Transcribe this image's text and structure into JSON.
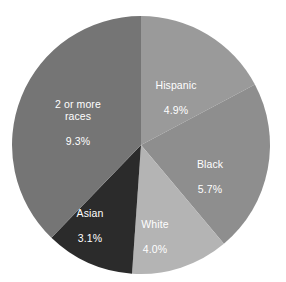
{
  "chart_data": {
    "type": "pie",
    "title": "",
    "subtitle": "",
    "xlabel": "",
    "ylabel": "",
    "legend": "none",
    "grid": false,
    "start_angle_deg": 0,
    "direction": "clockwise",
    "center": {
      "x": 141,
      "y": 145
    },
    "radius": 129,
    "categories": [
      "Hispanic",
      "Black",
      "White",
      "Asian",
      "2 or more races"
    ],
    "values": [
      4.9,
      5.7,
      4.0,
      3.1,
      9.3
    ],
    "value_suffix": "%",
    "slice_angles_deg": [
      62,
      78,
      44,
      40,
      136
    ],
    "colors": [
      "#9a9a9a",
      "#8e8e8e",
      "#b4b4b4",
      "#2b2b2b",
      "#757575"
    ],
    "slices": [
      {
        "label": "Hispanic",
        "value": 4.9,
        "value_text": "4.9%",
        "color": "#9a9a9a",
        "start_angle_deg": 0,
        "end_angle_deg": 62
      },
      {
        "label": "Black",
        "value": 5.7,
        "value_text": "5.7%",
        "color": "#8e8e8e",
        "start_angle_deg": 62,
        "end_angle_deg": 140
      },
      {
        "label": "White",
        "value": 4.0,
        "value_text": "4.0%",
        "color": "#b4b4b4",
        "start_angle_deg": 140,
        "end_angle_deg": 184
      },
      {
        "label": "Asian",
        "value": 3.1,
        "value_text": "3.1%",
        "color": "#2b2b2b",
        "start_angle_deg": 184,
        "end_angle_deg": 224
      },
      {
        "label": "2 or more races",
        "value": 9.3,
        "value_text": "9.3%",
        "color": "#757575",
        "start_angle_deg": 224,
        "end_angle_deg": 360
      }
    ]
  },
  "labels": {
    "hispanic": {
      "name": "Hispanic",
      "value": "4.9%"
    },
    "black": {
      "name": "Black",
      "value": "5.7%"
    },
    "white": {
      "name": "White",
      "value": "4.0%"
    },
    "asian": {
      "name": "Asian",
      "value": "3.1%"
    },
    "two_or_more": {
      "name": "2 or more\nraces",
      "value": "9.3%"
    }
  },
  "colors": {
    "background": "#ffffff",
    "label_text": "#ffffff"
  }
}
